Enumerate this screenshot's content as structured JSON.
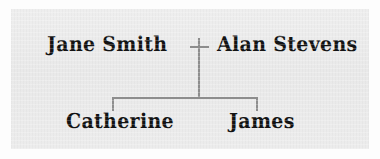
{
  "diagram": {
    "type": "family-tree",
    "background_color": "#ebebeb",
    "line_color": "#8d8d8d",
    "text_color": "#131313",
    "generations": [
      {
        "level": 1,
        "relationship": "marriage",
        "symbol": "+",
        "people": [
          {
            "id": "jane-smith",
            "name": "Jane Smith",
            "role": "parent"
          },
          {
            "id": "alan-stevens",
            "name": "Alan Stevens",
            "role": "parent"
          }
        ]
      },
      {
        "level": 2,
        "relationship": "siblings",
        "people": [
          {
            "id": "catherine",
            "name": "Catherine",
            "role": "child"
          },
          {
            "id": "james",
            "name": "James",
            "role": "child"
          }
        ]
      }
    ],
    "connectors": [
      {
        "id": "marriage-plus",
        "kind": "marriage-symbol"
      },
      {
        "id": "descent-line",
        "kind": "vertical-descent"
      },
      {
        "id": "sibling-bar",
        "kind": "horizontal-sibling-bar"
      },
      {
        "id": "child-stub-left",
        "kind": "vertical-stub"
      },
      {
        "id": "child-stub-right",
        "kind": "vertical-stub"
      }
    ]
  }
}
